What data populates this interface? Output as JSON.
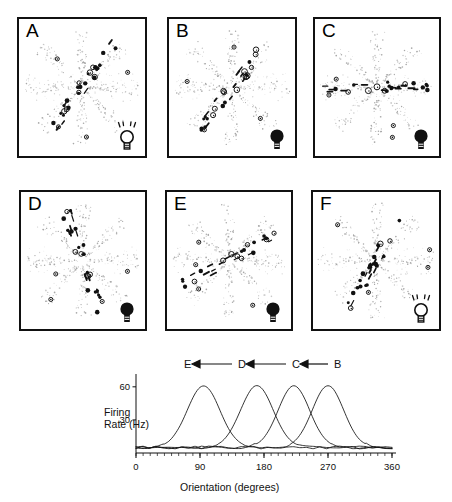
{
  "figure": {
    "background": "#ffffff",
    "ink": "#111111"
  },
  "panels": [
    {
      "label": "A",
      "bulb_state": "on",
      "bulb_icon": "lightbulb-on-icon",
      "orientation_axis_deg": 55,
      "cloud_seed": 11
    },
    {
      "label": "B",
      "bulb_state": "off",
      "bulb_icon": "lightbulb-off-icon",
      "orientation_axis_deg": 52,
      "cloud_seed": 23
    },
    {
      "label": "C",
      "bulb_state": "off",
      "bulb_icon": "lightbulb-off-icon",
      "orientation_axis_deg": 0,
      "cloud_seed": 37
    },
    {
      "label": "D",
      "bulb_state": "off",
      "bulb_icon": "lightbulb-off-icon",
      "orientation_axis_deg": 108,
      "cloud_seed": 49
    },
    {
      "label": "E",
      "bulb_state": "off",
      "bulb_icon": "lightbulb-off-icon",
      "orientation_axis_deg": 28,
      "cloud_seed": 61
    },
    {
      "label": "F",
      "bulb_state": "on",
      "bulb_icon": "lightbulb-on-icon",
      "orientation_axis_deg": 62,
      "cloud_seed": 73
    }
  ],
  "legend": {
    "items": [
      "E",
      "D",
      "C",
      "B"
    ],
    "arrow_glyph": "◀",
    "text": "E ◀ — D ◀ — C ◀ B"
  },
  "chart_data": {
    "type": "line",
    "title": "",
    "xlabel": "Orientation (degrees)",
    "ylabel": "Firing Rate (Hz)",
    "xlim": [
      0,
      360
    ],
    "ylim": [
      0,
      68
    ],
    "xticks": [
      0,
      90,
      180,
      270,
      360
    ],
    "xtick_labels": [
      "0",
      "90",
      "180",
      "270",
      "360"
    ],
    "yticks": [
      30,
      60
    ],
    "ytick_labels": [
      "30",
      "60"
    ],
    "grid": false,
    "legend_position": "above-plot",
    "minor_ticks": true,
    "baseline_hz": 5,
    "series": [
      {
        "name": "B",
        "peak_deg": 270,
        "peak_hz": 61,
        "halfwidth_deg": 26,
        "baseline_hz": 5
      },
      {
        "name": "C",
        "peak_deg": 222,
        "peak_hz": 61,
        "halfwidth_deg": 26,
        "baseline_hz": 5
      },
      {
        "name": "D",
        "peak_deg": 170,
        "peak_hz": 61,
        "halfwidth_deg": 27,
        "baseline_hz": 5
      },
      {
        "name": "E",
        "peak_deg": 95,
        "peak_hz": 61,
        "halfwidth_deg": 27,
        "baseline_hz": 5
      }
    ]
  }
}
